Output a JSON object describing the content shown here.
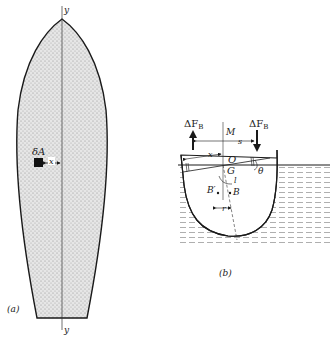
{
  "figure_a": {
    "label": "(a)",
    "axis_top": "y",
    "axis_bottom": "y",
    "element_label": "δA",
    "distance_label": "x"
  },
  "figure_b": {
    "label": "(b)",
    "force_left": "ΔF",
    "force_left_sub": "B",
    "force_right": "ΔF",
    "force_right_sub": "B",
    "metacenter": "M",
    "spacing": "s",
    "distance": "x",
    "origin": "O",
    "center_gravity": "G",
    "angle": "θ",
    "buoyancy_new": "B′",
    "buoyancy": "B",
    "length": "l",
    "shift": "r"
  },
  "colors": {
    "ink": "#1a1a1a",
    "hull_fill": "#d9d9d9",
    "water_dash": "#9a9a9a"
  }
}
